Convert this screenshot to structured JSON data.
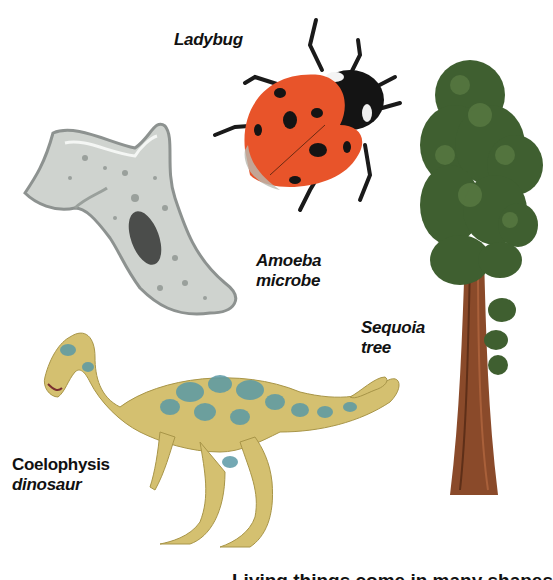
{
  "labels": {
    "ladybug": "Ladybug",
    "amoeba_line1": "Amoeba",
    "amoeba_line2": "microbe",
    "sequoia_line1": "Sequoia",
    "sequoia_line2": "tree",
    "dinosaur_line1": "Coelophysis",
    "dinosaur_line2": "dinosaur"
  },
  "caption": "Living things come in many shapes",
  "illustrations": [
    "ladybug-illustration",
    "amoeba-illustration",
    "sequoia-tree-illustration",
    "coelophysis-dinosaur-illustration"
  ],
  "colors": {
    "ladybug_red": "#e8542a",
    "ladybug_black": "#141414",
    "amoeba_gray": "#cfd3cf",
    "tree_green": "#3f5f30",
    "tree_trunk": "#8a4a2a",
    "dino_yellow": "#d4c070",
    "dino_blue": "#5b9aa6"
  }
}
